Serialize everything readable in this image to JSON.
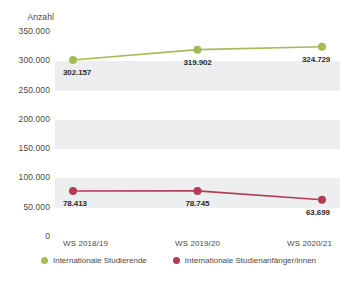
{
  "chart_data": {
    "type": "line",
    "title": "",
    "xlabel": "",
    "ylabel": "Anzahl",
    "categories": [
      "WS 2018/19",
      "WS 2019/20",
      "WS 2020/21"
    ],
    "ylim": [
      0,
      350000
    ],
    "ytick_values": [
      0,
      50000,
      100000,
      150000,
      200000,
      250000,
      300000,
      350000
    ],
    "ytick_labels": [
      "0",
      "50.000",
      "100.000",
      "150.000",
      "200.000",
      "250.000",
      "300.000",
      "350.000"
    ],
    "grid": false,
    "banded_background": true,
    "legend_position": "bottom",
    "series": [
      {
        "name": "Internationale Studierende",
        "color": "#a3bd56",
        "values": [
          302157,
          319902,
          324729
        ],
        "labels": [
          "302.157",
          "319.902",
          "324.729"
        ]
      },
      {
        "name": "Internationale Studienanfänger/innen",
        "color": "#b33c54",
        "values": [
          78413,
          78745,
          63699
        ],
        "labels": [
          "78.413",
          "78.745",
          "63.699"
        ]
      }
    ]
  },
  "colors": {
    "series_green": "#a3bd56",
    "series_red": "#b33c54",
    "band": "#eceef0",
    "text": "#4a4a4a",
    "label_text": "#2b2b2b",
    "background": "#ffffff"
  }
}
